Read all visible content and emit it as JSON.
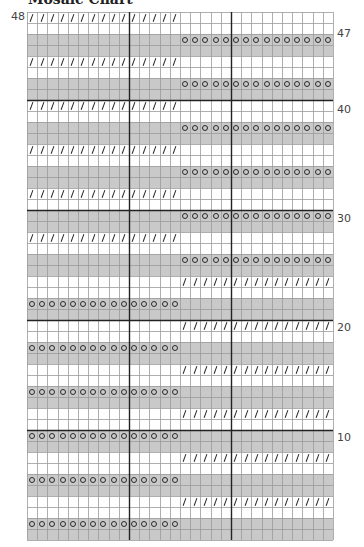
{
  "title": "Mosaic Chart",
  "colors": {
    "gray_row": "#c9c9c9",
    "white_row": "#ffffff",
    "grid_line": "#9a9a9a",
    "major_line": "#222222",
    "symbol": "#2a2a2a"
  },
  "grid": {
    "columns": 30,
    "rows": 48,
    "major_every": 10
  },
  "symbol_legend": {
    "o": "circle-symbol",
    "/": "slash-symbol"
  },
  "row_labels": [
    {
      "text": "48",
      "side": "left",
      "y": 11
    },
    {
      "text": "47",
      "side": "right",
      "y": 28
    },
    {
      "text": "40",
      "side": "right",
      "y": 104
    },
    {
      "text": "30",
      "side": "right",
      "y": 213
    },
    {
      "text": "20",
      "side": "right",
      "y": 322
    },
    {
      "text": "10",
      "side": "right",
      "y": 432
    }
  ],
  "rows": [
    {
      "n": 48,
      "color": "white",
      "symbol": "/",
      "span": "left"
    },
    {
      "n": 47,
      "color": "white",
      "symbol": "",
      "span": ""
    },
    {
      "n": 46,
      "color": "gray",
      "symbol": "o",
      "span": "right"
    },
    {
      "n": 45,
      "color": "gray",
      "symbol": "",
      "span": ""
    },
    {
      "n": 44,
      "color": "white",
      "symbol": "/",
      "span": "left"
    },
    {
      "n": 43,
      "color": "white",
      "symbol": "",
      "span": ""
    },
    {
      "n": 42,
      "color": "gray",
      "symbol": "o",
      "span": "right"
    },
    {
      "n": 41,
      "color": "gray",
      "symbol": "",
      "span": ""
    },
    {
      "n": 40,
      "color": "white",
      "symbol": "/",
      "span": "left"
    },
    {
      "n": 39,
      "color": "white",
      "symbol": "",
      "span": ""
    },
    {
      "n": 38,
      "color": "gray",
      "symbol": "o",
      "span": "right"
    },
    {
      "n": 37,
      "color": "gray",
      "symbol": "",
      "span": ""
    },
    {
      "n": 36,
      "color": "white",
      "symbol": "/",
      "span": "left"
    },
    {
      "n": 35,
      "color": "white",
      "symbol": "",
      "span": ""
    },
    {
      "n": 34,
      "color": "gray",
      "symbol": "o",
      "span": "right"
    },
    {
      "n": 33,
      "color": "gray",
      "symbol": "",
      "span": ""
    },
    {
      "n": 32,
      "color": "white",
      "symbol": "/",
      "span": "left"
    },
    {
      "n": 31,
      "color": "white",
      "symbol": "",
      "span": ""
    },
    {
      "n": 30,
      "color": "gray",
      "symbol": "o",
      "span": "right"
    },
    {
      "n": 29,
      "color": "gray",
      "symbol": "",
      "span": ""
    },
    {
      "n": 28,
      "color": "white",
      "symbol": "/",
      "span": "left"
    },
    {
      "n": 27,
      "color": "white",
      "symbol": "",
      "span": ""
    },
    {
      "n": 26,
      "color": "gray",
      "symbol": "o",
      "span": "right"
    },
    {
      "n": 25,
      "color": "gray",
      "symbol": "",
      "span": ""
    },
    {
      "n": 24,
      "color": "white",
      "symbol": "/",
      "span": "right"
    },
    {
      "n": 23,
      "color": "white",
      "symbol": "",
      "span": ""
    },
    {
      "n": 22,
      "color": "gray",
      "symbol": "o",
      "span": "left"
    },
    {
      "n": 21,
      "color": "gray",
      "symbol": "",
      "span": ""
    },
    {
      "n": 20,
      "color": "white",
      "symbol": "/",
      "span": "right"
    },
    {
      "n": 19,
      "color": "white",
      "symbol": "",
      "span": ""
    },
    {
      "n": 18,
      "color": "gray",
      "symbol": "o",
      "span": "left"
    },
    {
      "n": 17,
      "color": "gray",
      "symbol": "",
      "span": ""
    },
    {
      "n": 16,
      "color": "white",
      "symbol": "/",
      "span": "right"
    },
    {
      "n": 15,
      "color": "white",
      "symbol": "",
      "span": ""
    },
    {
      "n": 14,
      "color": "gray",
      "symbol": "o",
      "span": "left"
    },
    {
      "n": 13,
      "color": "gray",
      "symbol": "",
      "span": ""
    },
    {
      "n": 12,
      "color": "white",
      "symbol": "/",
      "span": "right"
    },
    {
      "n": 11,
      "color": "white",
      "symbol": "",
      "span": ""
    },
    {
      "n": 10,
      "color": "gray",
      "symbol": "o",
      "span": "left"
    },
    {
      "n": 9,
      "color": "gray",
      "symbol": "",
      "span": ""
    },
    {
      "n": 8,
      "color": "white",
      "symbol": "/",
      "span": "right"
    },
    {
      "n": 7,
      "color": "white",
      "symbol": "",
      "span": ""
    },
    {
      "n": 6,
      "color": "gray",
      "symbol": "o",
      "span": "left"
    },
    {
      "n": 5,
      "color": "gray",
      "symbol": "",
      "span": ""
    },
    {
      "n": 4,
      "color": "white",
      "symbol": "/",
      "span": "right"
    },
    {
      "n": 3,
      "color": "white",
      "symbol": "",
      "span": ""
    },
    {
      "n": 2,
      "color": "gray",
      "symbol": "o",
      "span": "left"
    },
    {
      "n": 1,
      "color": "gray",
      "symbol": "",
      "span": ""
    }
  ]
}
